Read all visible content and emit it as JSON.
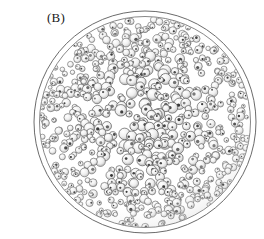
{
  "figure": {
    "panel_label": "(B)",
    "background_color": "#ffffff",
    "ink_color": "#2b2b2b"
  },
  "specimen": {
    "outer_membrane": {
      "name": "outer-membrane",
      "center_x": 145,
      "center_y": 122,
      "radius": 111,
      "stroke_color": "#5a5a5a",
      "stroke_width": 0.9,
      "fill": "none"
    },
    "cell_mass": {
      "name": "cell-mass",
      "center_x": 145,
      "center_y": 122,
      "radius": 105,
      "cell_count": 620,
      "cell_radius_min": 3.0,
      "cell_radius_max": 6.2,
      "cell_fill": "#f2f2f2",
      "cell_stroke": "#4a4a4a",
      "nucleus_fill": "#2a2a2a",
      "nucleus_radius_min": 0.7,
      "nucleus_radius_max": 1.7,
      "shading_color": "#9a9a9a"
    }
  },
  "chart_data": {
    "type": "scatter",
    "title": "(B)",
    "xlabel": "",
    "ylabel": "",
    "xlim": [
      34,
      256
    ],
    "ylim": [
      11,
      233
    ],
    "grid": false,
    "legend": null,
    "annotations": [
      "(B)"
    ],
    "series": [
      {
        "name": "colony-cells",
        "marker": "circle",
        "description": "individual cells packed within the spherical colony",
        "count": 620
      }
    ]
  }
}
